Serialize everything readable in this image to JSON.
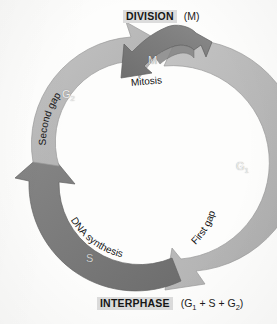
{
  "diagram": {
    "headers": {
      "top": {
        "title": "DIVISION",
        "paren_prefix": "(M",
        "paren_suffix": ")"
      },
      "bottom": {
        "title": "INTERPHASE",
        "paren_open": "(G",
        "paren_sub1": "1",
        "paren_mid": " + S + G",
        "paren_sub2": "2",
        "paren_close": ")"
      }
    },
    "phases": [
      {
        "id": "G2",
        "letter": "G",
        "subscript": "2",
        "description": "Second gap",
        "band_color": "#b8b8b8",
        "letter_color": "#efefef"
      },
      {
        "id": "M",
        "letter": "M",
        "subscript": "",
        "description": "Mitosis",
        "band_color": "#7a7a7a",
        "letter_color": "#e6e6e6"
      },
      {
        "id": "G1",
        "letter": "G",
        "subscript": "1",
        "description": "First gap",
        "band_color": "#b8b8b8",
        "letter_color": "#efefef"
      },
      {
        "id": "S",
        "letter": "S",
        "subscript": "",
        "description": "DNA synthesis",
        "band_color": "#7a7a7a",
        "letter_color": "#cfcfcf"
      }
    ],
    "colors": {
      "background": "#fdfdfc",
      "light_band": "#b8b8b8",
      "dark_band": "#7a7a7a",
      "header_highlight": "#dcdcdc",
      "text": "#141414"
    }
  }
}
